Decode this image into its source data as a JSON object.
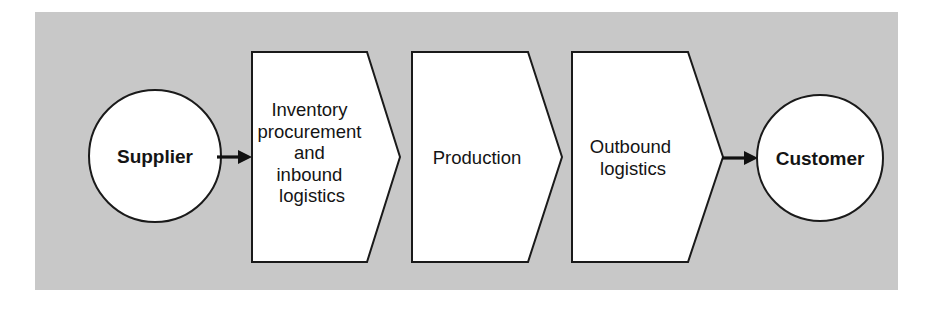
{
  "diagram": {
    "panel": {
      "background_color": "#c8c8c8",
      "x": 35,
      "y": 12,
      "width": 863,
      "height": 278
    },
    "colors": {
      "panel_background": "#c8c8c8",
      "shape_fill": "#ffffff",
      "shape_stroke": "#1a1a1a",
      "text": "#141414",
      "arrow": "#111111",
      "page_background": "#ffffff"
    },
    "nodes": [
      {
        "id": "supplier",
        "shape": "circle",
        "label": "Supplier",
        "bold": true,
        "cx": 155,
        "cy": 156,
        "r": 66
      },
      {
        "id": "inbound",
        "shape": "chevron",
        "label_lines": [
          "Inventory",
          "procurement",
          "and",
          "inbound",
          "logistics"
        ],
        "bold": false,
        "left": 252,
        "shoulder": 367,
        "apex": 400,
        "top": 52,
        "bottom": 262,
        "text_cx": 312,
        "text_cy": 157
      },
      {
        "id": "production",
        "shape": "chevron",
        "label_lines": [
          "Production"
        ],
        "bold": false,
        "left": 412,
        "shoulder": 528,
        "apex": 562,
        "top": 52,
        "bottom": 262,
        "text_cx": 477,
        "text_cy": 157
      },
      {
        "id": "outbound",
        "shape": "chevron",
        "label_lines": [
          "Outbound",
          "logistics"
        ],
        "bold": false,
        "left": 572,
        "shoulder": 688,
        "apex": 723,
        "top": 52,
        "bottom": 262,
        "text_cx": 633,
        "text_cy": 157
      },
      {
        "id": "customer",
        "shape": "circle",
        "label": "Customer",
        "bold": true,
        "cx": 820,
        "cy": 158,
        "r": 63
      }
    ],
    "connectors": [
      {
        "id": "supplier-to-inbound",
        "from": "supplier",
        "to": "inbound",
        "x1": 217,
        "x2": 252,
        "y": 157,
        "arrowhead": "end"
      },
      {
        "id": "outbound-to-customer",
        "from": "outbound",
        "to": "customer",
        "x1": 722,
        "x2": 758,
        "y": 158,
        "arrowhead": "end"
      }
    ]
  }
}
